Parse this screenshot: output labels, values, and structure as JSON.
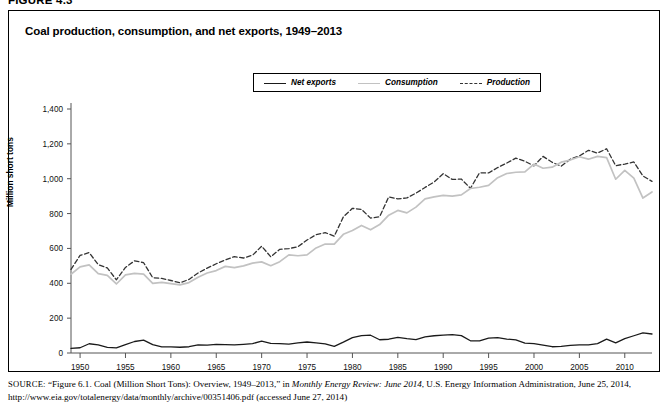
{
  "figure": {
    "number_label": "FIGURE 4.3",
    "title": "Coal production, consumption, and net exports, 1949–2013"
  },
  "legend": {
    "position": "top-center",
    "items": [
      {
        "label": "Net exports",
        "style": "solid",
        "color": "#1a1a1a"
      },
      {
        "label": "Consumption",
        "style": "solid",
        "color": "#c2c2c2"
      },
      {
        "label": "Production",
        "style": "dashed",
        "color": "#333333"
      }
    ]
  },
  "source": {
    "prefix": "SOURCE:",
    "line1_a": " “Figure 6.1. Coal (Million Short Tons): Overview, 1949–2013,” in ",
    "line1_italic": "Monthly Energy Review: June 2014",
    "line1_b": ", U.S. Energy Information Administration,",
    "line2": "June 25, 2014, http://www.eia.gov/totalenergy/data/monthly/archive/00351406.pdf (accessed June 27, 2014)"
  },
  "chart_data": {
    "type": "line",
    "title": "Coal production, consumption, and net exports, 1949–2013",
    "xlabel": "",
    "ylabel": "Million short tons",
    "xlim": [
      1949,
      2013
    ],
    "ylim": [
      0,
      1400
    ],
    "grid": false,
    "legend_position": "top-center",
    "xticks": [
      1950,
      1955,
      1960,
      1965,
      1970,
      1975,
      1980,
      1985,
      1990,
      1995,
      2000,
      2005,
      2010
    ],
    "yticks": [
      0,
      200,
      400,
      600,
      800,
      1000,
      1200,
      1400
    ],
    "ytick_labels": [
      "0",
      "200",
      "400",
      "600",
      "800",
      "1,000",
      "1,200",
      "1,400"
    ],
    "x": [
      1949,
      1950,
      1951,
      1952,
      1953,
      1954,
      1955,
      1956,
      1957,
      1958,
      1959,
      1960,
      1961,
      1962,
      1963,
      1964,
      1965,
      1966,
      1967,
      1968,
      1969,
      1970,
      1971,
      1972,
      1973,
      1974,
      1975,
      1976,
      1977,
      1978,
      1979,
      1980,
      1981,
      1982,
      1983,
      1984,
      1985,
      1986,
      1987,
      1988,
      1989,
      1990,
      1991,
      1992,
      1993,
      1994,
      1995,
      1996,
      1997,
      1998,
      1999,
      2000,
      2001,
      2002,
      2003,
      2004,
      2005,
      2006,
      2007,
      2008,
      2009,
      2010,
      2011,
      2012,
      2013
    ],
    "series": [
      {
        "name": "Production",
        "style": "dashed",
        "color": "#333333",
        "values": [
          480,
          560,
          576,
          507,
          488,
          420,
          491,
          529,
          518,
          432,
          428,
          416,
          403,
          422,
          459,
          487,
          512,
          534,
          553,
          545,
          561,
          613,
          552,
          595,
          599,
          610,
          648,
          679,
          691,
          670,
          781,
          830,
          824,
          774,
          782,
          896,
          884,
          890,
          917,
          950,
          981,
          1029,
          996,
          998,
          945,
          1034,
          1033,
          1064,
          1090,
          1118,
          1100,
          1074,
          1128,
          1094,
          1072,
          1112,
          1131,
          1163,
          1147,
          1172,
          1075,
          1084,
          1096,
          1016,
          985
        ]
      },
      {
        "name": "Consumption",
        "style": "solid",
        "color": "#c2c2c2",
        "values": [
          452,
          494,
          506,
          455,
          445,
          396,
          448,
          457,
          452,
          399,
          405,
          398,
          391,
          404,
          435,
          459,
          473,
          497,
          490,
          500,
          516,
          523,
          501,
          524,
          563,
          558,
          563,
          603,
          625,
          625,
          681,
          703,
          732,
          707,
          737,
          791,
          818,
          804,
          837,
          884,
          896,
          904,
          900,
          907,
          944,
          951,
          962,
          1006,
          1030,
          1037,
          1039,
          1084,
          1060,
          1066,
          1095,
          1107,
          1126,
          1112,
          1128,
          1121,
          997,
          1048,
          1003,
          889,
          924
        ]
      },
      {
        "name": "Net exports",
        "style": "solid",
        "color": "#1a1a1a",
        "values": [
          26,
          30,
          53,
          46,
          32,
          29,
          48,
          66,
          74,
          48,
          35,
          35,
          33,
          36,
          46,
          45,
          49,
          48,
          47,
          50,
          54,
          68,
          55,
          54,
          51,
          58,
          63,
          58,
          52,
          38,
          62,
          88,
          100,
          102,
          76,
          79,
          90,
          82,
          77,
          92,
          99,
          103,
          105,
          100,
          70,
          69,
          85,
          88,
          80,
          75,
          57,
          54,
          45,
          36,
          38,
          44,
          47,
          47,
          54,
          80,
          58,
          82,
          99,
          115,
          109
        ]
      }
    ]
  }
}
